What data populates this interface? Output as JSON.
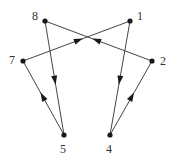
{
  "diagram": {
    "type": "directed-graph",
    "colors": {
      "edge": "#444444",
      "node": "#1a1a1a",
      "label": "#333333",
      "background": "#ffffff"
    },
    "nodes": [
      {
        "id": "1",
        "label": "1",
        "x": 130,
        "y": 21,
        "lx": 137,
        "ly": 20
      },
      {
        "id": "2",
        "label": "2",
        "x": 152,
        "y": 61,
        "lx": 160,
        "ly": 65
      },
      {
        "id": "4",
        "label": "4",
        "x": 110,
        "y": 135,
        "lx": 106,
        "ly": 153
      },
      {
        "id": "5",
        "label": "5",
        "x": 64,
        "y": 135,
        "lx": 60,
        "ly": 153
      },
      {
        "id": "7",
        "label": "7",
        "x": 23,
        "y": 61,
        "lx": 9,
        "ly": 64
      },
      {
        "id": "8",
        "label": "8",
        "x": 45,
        "y": 21,
        "lx": 32,
        "ly": 20
      }
    ],
    "edges": [
      {
        "from": "8",
        "to": "5"
      },
      {
        "from": "5",
        "to": "7"
      },
      {
        "from": "7",
        "to": "1"
      },
      {
        "from": "1",
        "to": "4"
      },
      {
        "from": "4",
        "to": "2"
      },
      {
        "from": "2",
        "to": "8"
      }
    ]
  }
}
